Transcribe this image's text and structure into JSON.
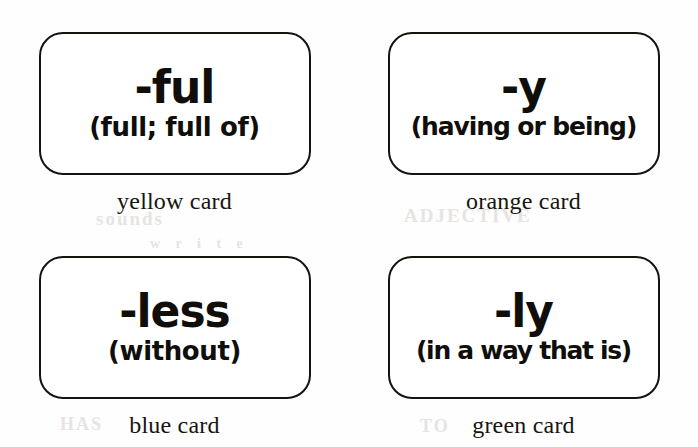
{
  "page": {
    "background_color": "#fefefe",
    "ink_color": "#15130f",
    "ghost_marks": [
      "sounds",
      "ADJECTIVE",
      "HAS",
      "TO",
      "w r i t e"
    ]
  },
  "cards": [
    {
      "id": "ful",
      "headword": "-ful",
      "gloss": "(full; full of)",
      "caption": "yellow card",
      "color_name": "yellow",
      "gloss_width": "normal"
    },
    {
      "id": "y",
      "headword": "-y",
      "gloss": "(having or being)",
      "caption": "orange card",
      "color_name": "orange",
      "gloss_width": "wide"
    },
    {
      "id": "less",
      "headword": "-less",
      "gloss": "(without)",
      "caption": "blue card",
      "color_name": "blue",
      "gloss_width": "normal"
    },
    {
      "id": "ly",
      "headword": "-ly",
      "gloss": "(in a way that is)",
      "caption": "green card",
      "color_name": "green",
      "gloss_width": "widest"
    }
  ]
}
